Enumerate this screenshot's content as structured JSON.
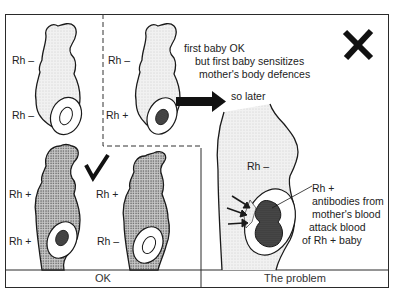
{
  "diagram": {
    "panels": {
      "ok": {
        "caption": "OK",
        "scenarios": [
          {
            "mother_label": "Rh –",
            "baby_label": "Rh –"
          },
          {
            "mother_label": "Rh +",
            "baby_label": "Rh +"
          },
          {
            "mother_label": "Rh +",
            "baby_label": "Rh –"
          }
        ],
        "mark": "check-mark"
      },
      "sensitize": {
        "mother_label": "Rh –",
        "baby_label": "Rh +",
        "note_line1": "first baby OK",
        "note_line2": "but first baby sensitizes",
        "note_line3": "mother's body defences",
        "arrow_label": "so later"
      },
      "problem": {
        "caption": "The problem",
        "mother_label": "Rh –",
        "baby_label": "Rh +",
        "explanation": [
          "antibodies from",
          "mother's blood",
          "attack blood",
          "of Rh +  baby"
        ],
        "mark": "x-mark"
      }
    },
    "colors": {
      "line": "#1a1a1a",
      "stipple_light": "#e6e6e6",
      "stipple_dark": "#9a9a9a",
      "baby_dark": "#3a3a3a"
    }
  }
}
